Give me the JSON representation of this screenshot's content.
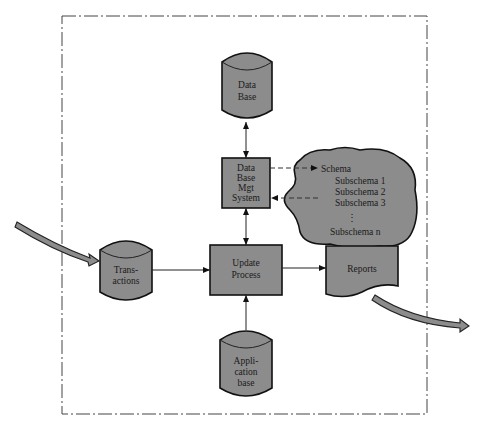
{
  "diagram": {
    "nodes": {
      "database": {
        "lines": [
          "Data",
          "Base"
        ],
        "shape": "cylinder"
      },
      "dbms": {
        "lines": [
          "Data",
          "Base",
          "Mgt",
          "System"
        ],
        "shape": "rectangle"
      },
      "schema_cloud": {
        "lines": [
          "Schema",
          "Subschema 1",
          "Subschema 2",
          "Subschema 3",
          "⋮",
          "Subschema n"
        ],
        "shape": "cloud"
      },
      "transactions": {
        "lines": [
          "Trans-",
          "actions"
        ],
        "shape": "cylinder"
      },
      "update_process": {
        "lines": [
          "Update",
          "Process"
        ],
        "shape": "rectangle"
      },
      "reports": {
        "lines": [
          "Reports"
        ],
        "shape": "document"
      },
      "application_base": {
        "lines": [
          "Appli-",
          "cation",
          "base"
        ],
        "shape": "cylinder"
      }
    },
    "edges": [
      {
        "from": "database",
        "to": "dbms",
        "style": "solid",
        "direction": "both"
      },
      {
        "from": "dbms",
        "to": "schema_cloud",
        "style": "dashed",
        "direction": "forward"
      },
      {
        "from": "schema_cloud",
        "to": "dbms",
        "style": "dashed",
        "direction": "forward"
      },
      {
        "from": "dbms",
        "to": "update_process",
        "style": "solid",
        "direction": "both"
      },
      {
        "from": "transactions",
        "to": "update_process",
        "style": "solid",
        "direction": "forward"
      },
      {
        "from": "update_process",
        "to": "reports",
        "style": "solid",
        "direction": "forward"
      },
      {
        "from": "application_base",
        "to": "update_process",
        "style": "solid",
        "direction": "forward"
      },
      {
        "from": "external-input",
        "to": "transactions",
        "style": "thick-flow",
        "direction": "forward"
      },
      {
        "from": "reports",
        "to": "external-output",
        "style": "thick-flow",
        "direction": "forward"
      }
    ],
    "colors": {
      "fill": "#8c8c8c",
      "stroke": "#111111",
      "background": "#ffffff"
    }
  }
}
